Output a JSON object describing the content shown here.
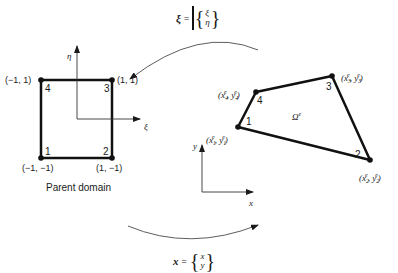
{
  "parent_domain": {
    "caption": "Parent domain",
    "axes": {
      "horizontal": "ξ",
      "vertical": "η"
    },
    "nodes": [
      {
        "num": "1",
        "coord": "(−1, −1)"
      },
      {
        "num": "2",
        "coord": "(1, −1)"
      },
      {
        "num": "3",
        "coord": "(1, 1)"
      },
      {
        "num": "4",
        "coord": "(−1, 1)"
      }
    ]
  },
  "physical_element": {
    "domain_label": "Ω",
    "domain_sup": "e",
    "axes": {
      "horizontal": "x",
      "vertical": "y"
    },
    "nodes": [
      {
        "num": "1",
        "x": "x",
        "y": "y",
        "sup": "e",
        "sub": "1"
      },
      {
        "num": "2",
        "x": "x",
        "y": "y",
        "sup": "e",
        "sub": "2"
      },
      {
        "num": "3",
        "x": "x",
        "y": "y",
        "sup": "e",
        "sub": "3"
      },
      {
        "num": "4",
        "x": "x",
        "y": "y",
        "sup": "e",
        "sub": "4"
      }
    ]
  },
  "mappings": {
    "to_parent": {
      "symbol": "ξ",
      "equals": "=",
      "top": "ξ",
      "bottom": "η"
    },
    "to_physical": {
      "symbol": "x",
      "equals": "=",
      "top": "x",
      "bottom": "y"
    }
  }
}
